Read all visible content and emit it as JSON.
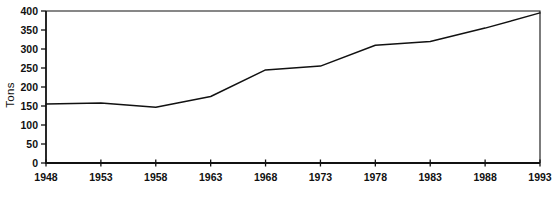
{
  "chart_data": {
    "type": "line",
    "title": "",
    "xlabel": "",
    "ylabel": "Tons",
    "x": [
      1948,
      1953,
      1958,
      1963,
      1968,
      1973,
      1978,
      1983,
      1988,
      1993
    ],
    "x_tick_labels": [
      "1948",
      "1953",
      "1958",
      "1963",
      "1968",
      "1973",
      "1978",
      "1983",
      "1988",
      "1993"
    ],
    "series": [
      {
        "name": "Tons",
        "values": [
          155,
          158,
          147,
          175,
          245,
          255,
          310,
          320,
          355,
          395
        ]
      }
    ],
    "ylim": [
      0,
      400
    ],
    "y_ticks": [
      0,
      50,
      100,
      150,
      200,
      250,
      300,
      350,
      400
    ],
    "grid": "off",
    "legend": "none",
    "colors": {
      "line": "#111111",
      "axis": "#111111",
      "background": "#ffffff"
    }
  }
}
